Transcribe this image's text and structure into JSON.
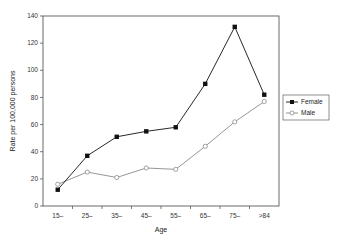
{
  "chart_data": {
    "type": "line",
    "title": "",
    "xlabel": "Age",
    "ylabel": "Rate per 100,000 persons",
    "categories": [
      "15–",
      "25–",
      "35–",
      "45–",
      "55–",
      "65–",
      "75–",
      ">84"
    ],
    "ylim": [
      0,
      140
    ],
    "yticks": [
      0,
      20,
      40,
      60,
      80,
      100,
      120,
      140
    ],
    "grid": false,
    "legend_position": "right",
    "series": [
      {
        "name": "Female",
        "marker": "filled-square",
        "color": "#111111",
        "values": [
          12,
          37,
          51,
          55,
          58,
          90,
          132,
          82
        ]
      },
      {
        "name": "Male",
        "marker": "open-circle",
        "color": "#8a8a8a",
        "values": [
          16,
          25,
          21,
          28,
          27,
          44,
          62,
          77
        ]
      }
    ]
  }
}
